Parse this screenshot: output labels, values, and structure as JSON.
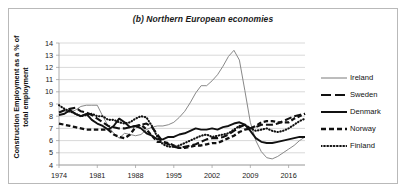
{
  "chart_data": {
    "type": "line",
    "title": "(b) Northern European economies",
    "xlabel": "",
    "ylabel": "Construction Employment as a % of total  employment",
    "ylim": [
      4,
      14
    ],
    "xlim": [
      1974,
      2019
    ],
    "ytick_labels": [
      "14",
      "13",
      "12",
      "11",
      "10",
      "9",
      "8",
      "7",
      "6",
      "5",
      "4"
    ],
    "xtick_labels": [
      "1974",
      "1981",
      "1988",
      "1995",
      "2002",
      "2009",
      "2016"
    ],
    "grid": "horizontal",
    "legend_position": "right",
    "series": [
      {
        "name": "Ireland",
        "style": "thin-solid",
        "color": "#7a7a7a",
        "x": [
          1974,
          1975,
          1976,
          1977,
          1978,
          1979,
          1980,
          1981,
          1982,
          1983,
          1984,
          1985,
          1986,
          1987,
          1988,
          1989,
          1990,
          1991,
          1992,
          1993,
          1994,
          1995,
          1996,
          1997,
          1998,
          1999,
          2000,
          2001,
          2002,
          2003,
          2004,
          2005,
          2006,
          2007,
          2008,
          2009,
          2010,
          2011,
          2012,
          2013,
          2014,
          2015,
          2016,
          2017,
          2018,
          2019
        ],
        "values": [
          8.3,
          8.4,
          8.3,
          8.5,
          8.8,
          8.9,
          8.9,
          8.9,
          8.0,
          7.2,
          6.6,
          6.2,
          6.6,
          6.5,
          6.4,
          6.5,
          6.9,
          7.1,
          7.2,
          7.2,
          7.3,
          7.5,
          7.9,
          8.4,
          9.1,
          9.9,
          10.5,
          10.5,
          10.9,
          11.4,
          12.1,
          12.9,
          13.4,
          12.6,
          10.1,
          7.5,
          6.0,
          5.1,
          4.6,
          4.5,
          4.7,
          5.0,
          5.3,
          5.6,
          6.0,
          6.3
        ]
      },
      {
        "name": "Sweden",
        "style": "long-dash",
        "color": "#111111",
        "x": [
          1974,
          1975,
          1976,
          1977,
          1978,
          1979,
          1980,
          1981,
          1982,
          1983,
          1984,
          1985,
          1986,
          1987,
          1988,
          1989,
          1990,
          1991,
          1992,
          1993,
          1994,
          1995,
          1996,
          1997,
          1998,
          1999,
          2000,
          2001,
          2002,
          2003,
          2004,
          2005,
          2006,
          2007,
          2008,
          2009,
          2010,
          2011,
          2012,
          2013,
          2014,
          2015,
          2016,
          2017,
          2018,
          2019
        ],
        "values": [
          8.3,
          8.5,
          8.6,
          8.7,
          8.4,
          8.3,
          8.1,
          7.8,
          7.5,
          7.2,
          7.1,
          7.0,
          7.0,
          7.1,
          7.2,
          7.3,
          7.4,
          7.1,
          6.5,
          5.9,
          5.7,
          5.5,
          5.4,
          5.5,
          5.6,
          5.7,
          5.9,
          6.1,
          6.2,
          6.2,
          6.3,
          6.5,
          6.8,
          7.1,
          7.3,
          7.0,
          7.1,
          7.3,
          7.3,
          7.3,
          7.4,
          7.6,
          7.8,
          8.0,
          8.1,
          8.2
        ]
      },
      {
        "name": "Denmark",
        "style": "thick-solid",
        "color": "#111111",
        "x": [
          1974,
          1975,
          1976,
          1977,
          1978,
          1979,
          1980,
          1981,
          1982,
          1983,
          1984,
          1985,
          1986,
          1987,
          1988,
          1989,
          1990,
          1991,
          1992,
          1993,
          1994,
          1995,
          1996,
          1997,
          1998,
          1999,
          2000,
          2001,
          2002,
          2003,
          2004,
          2005,
          2006,
          2007,
          2008,
          2009,
          2010,
          2011,
          2012,
          2013,
          2014,
          2015,
          2016,
          2017,
          2018,
          2019
        ],
        "values": [
          8.1,
          8.2,
          8.5,
          8.2,
          8.0,
          8.2,
          7.7,
          7.4,
          7.2,
          6.9,
          7.2,
          7.8,
          7.5,
          7.1,
          7.2,
          7.0,
          6.6,
          6.4,
          6.1,
          6.1,
          6.3,
          6.3,
          6.5,
          6.6,
          6.8,
          7.0,
          6.9,
          6.9,
          7.0,
          6.9,
          7.1,
          7.2,
          7.4,
          7.5,
          7.3,
          6.8,
          6.2,
          5.9,
          5.8,
          5.8,
          5.9,
          6.0,
          6.1,
          6.2,
          6.3,
          6.3
        ]
      },
      {
        "name": "Norway",
        "style": "medium-dash",
        "color": "#111111",
        "x": [
          1974,
          1975,
          1976,
          1977,
          1978,
          1979,
          1980,
          1981,
          1982,
          1983,
          1984,
          1985,
          1986,
          1987,
          1988,
          1989,
          1990,
          1991,
          1992,
          1993,
          1994,
          1995,
          1996,
          1997,
          1998,
          1999,
          2000,
          2001,
          2002,
          2003,
          2004,
          2005,
          2006,
          2007,
          2008,
          2009,
          2010,
          2011,
          2012,
          2013,
          2014,
          2015,
          2016,
          2017,
          2018,
          2019
        ],
        "values": [
          7.4,
          7.3,
          7.2,
          7.1,
          7.0,
          6.9,
          6.9,
          6.9,
          6.9,
          6.9,
          6.5,
          6.3,
          6.2,
          6.5,
          7.1,
          7.3,
          6.9,
          6.4,
          5.9,
          5.9,
          5.8,
          5.6,
          5.4,
          5.4,
          5.5,
          5.6,
          5.6,
          5.7,
          5.8,
          5.8,
          6.0,
          6.2,
          6.4,
          6.7,
          6.9,
          7.0,
          7.2,
          7.5,
          7.6,
          7.6,
          7.5,
          7.5,
          7.5,
          7.8,
          8.0,
          8.2
        ]
      },
      {
        "name": "Finland",
        "style": "dotted",
        "color": "#111111",
        "x": [
          1974,
          1975,
          1976,
          1977,
          1978,
          1979,
          1980,
          1981,
          1982,
          1983,
          1984,
          1985,
          1986,
          1987,
          1988,
          1989,
          1990,
          1991,
          1992,
          1993,
          1994,
          1995,
          1996,
          1997,
          1998,
          1999,
          2000,
          2001,
          2002,
          2003,
          2004,
          2005,
          2006,
          2007,
          2008,
          2009,
          2010,
          2011,
          2012,
          2013,
          2014,
          2015,
          2016,
          2017,
          2018,
          2019
        ],
        "values": [
          8.9,
          8.6,
          8.4,
          8.2,
          8.0,
          8.1,
          8.2,
          8.0,
          8.0,
          7.7,
          7.7,
          7.5,
          7.4,
          7.5,
          7.8,
          8.0,
          7.9,
          7.2,
          6.3,
          5.7,
          5.5,
          5.5,
          5.6,
          5.8,
          6.0,
          6.2,
          6.4,
          6.5,
          6.3,
          6.4,
          6.5,
          6.6,
          6.9,
          7.2,
          7.3,
          7.0,
          6.8,
          6.9,
          7.0,
          6.8,
          6.7,
          6.8,
          7.0,
          7.3,
          7.6,
          7.8
        ]
      }
    ]
  },
  "legend": {
    "items": [
      {
        "label": "Ireland"
      },
      {
        "label": "Sweden"
      },
      {
        "label": "Denmark"
      },
      {
        "label": "Norway"
      },
      {
        "label": "Finland"
      }
    ]
  }
}
